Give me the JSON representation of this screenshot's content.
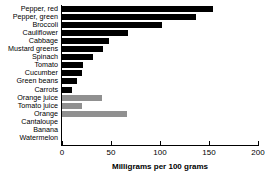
{
  "chart_data": {
    "type": "bar",
    "orientation": "horizontal",
    "title": "",
    "subtitle": "",
    "xlabel": "Milligrams per 100 grams",
    "ylabel": "",
    "xlim": [
      0,
      200
    ],
    "xticks": [
      0,
      50,
      100,
      150,
      200
    ],
    "xtick_labels": [
      "0",
      "50",
      "100",
      "150",
      "200"
    ],
    "grid": false,
    "legend": false,
    "categories": [
      "Pepper, red",
      "Pepper, green",
      "Broccoli",
      "Cauliflower",
      "Cabbage",
      "Mustard greens",
      "Spinach",
      "Tomato",
      "Cucumber",
      "Green beans",
      "Carrots",
      "Orange juice",
      "Tomato juice",
      "Orange",
      "Cantaloupe",
      "Banana",
      "Watermelon"
    ],
    "values": [
      154,
      137,
      102,
      67,
      48,
      42,
      32,
      21,
      20,
      15,
      10,
      41,
      20,
      66,
      0,
      0,
      0
    ],
    "bar_colors": [
      "#000000",
      "#000000",
      "#000000",
      "#000000",
      "#000000",
      "#000000",
      "#000000",
      "#000000",
      "#000000",
      "#000000",
      "#000000",
      "#909090",
      "#909090",
      "#909090",
      "#909090",
      "#909090",
      "#909090"
    ],
    "color_groups": {
      "vegetable": "#000000",
      "fruit": "#909090"
    }
  },
  "colors": {
    "background": "#ffffff",
    "axis": "#000000",
    "text": "#000000",
    "bar_dark": "#000000",
    "bar_light": "#909090"
  }
}
